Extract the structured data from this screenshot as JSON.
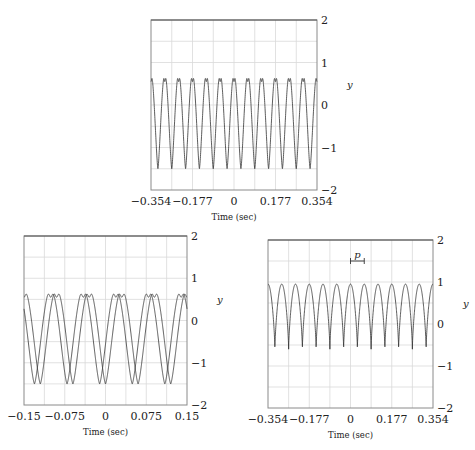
{
  "chart_data": [
    {
      "id": "top",
      "type": "line",
      "title": "",
      "xlabel": "Time (sec)",
      "ylabel": "y",
      "xlim": [
        -0.354,
        0.354
      ],
      "ylim": [
        -2,
        2
      ],
      "xticks": [
        -0.354,
        -0.177,
        0,
        0.177,
        0.354
      ],
      "xtick_labels": [
        "−0.354",
        "−0.177",
        "0",
        "0.177",
        "0.354"
      ],
      "yticks": [
        -2,
        -1,
        0,
        1,
        2
      ],
      "ytick_labels": [
        "−2",
        "−1",
        "0",
        "1",
        "2"
      ],
      "grid": true,
      "vgrid": 8,
      "hgrid": 8,
      "waveform": "m-peak",
      "periods": 12,
      "peak": 0.75,
      "peak_dip": 0.55,
      "trough": -1.5,
      "traces": 1,
      "phase_offsets": [
        0
      ],
      "box": {
        "x": 151,
        "y": 20,
        "w": 166,
        "h": 170
      }
    },
    {
      "id": "bottom-left",
      "type": "line",
      "title": "",
      "xlabel": "Time (sec)",
      "ylabel": "y",
      "xlim": [
        -0.15,
        0.15
      ],
      "ylim": [
        -2,
        2
      ],
      "xticks": [
        -0.15,
        -0.075,
        0,
        0.075,
        0.15
      ],
      "xtick_labels": [
        "−0.15",
        "−0.075",
        "0",
        "0.075",
        "0.15"
      ],
      "yticks": [
        -2,
        -1,
        0,
        1,
        2
      ],
      "ytick_labels": [
        "−2",
        "−1",
        "0",
        "1",
        "2"
      ],
      "grid": true,
      "vgrid": 8,
      "hgrid": 8,
      "waveform": "m-peak",
      "periods": 5,
      "peak": 0.75,
      "peak_dip": 0.55,
      "trough": -1.5,
      "traces": 2,
      "phase_offsets": [
        0,
        0.18
      ],
      "box": {
        "x": 24,
        "y": 236,
        "w": 163,
        "h": 169
      }
    },
    {
      "id": "bottom-right",
      "type": "line",
      "title": "",
      "xlabel": "Time (sec)",
      "ylabel": "y",
      "xlim": [
        -0.354,
        0.354
      ],
      "ylim": [
        -2,
        2
      ],
      "xticks": [
        -0.354,
        -0.177,
        0,
        0.177,
        0.354
      ],
      "xtick_labels": [
        "−0.354",
        "−0.177",
        "0",
        "0.177",
        "0.354"
      ],
      "yticks": [
        -2,
        -1,
        0,
        1,
        2
      ],
      "ytick_labels": [
        "−2",
        "−1",
        "0",
        "1",
        "2"
      ],
      "grid": true,
      "vgrid": 8,
      "hgrid": 8,
      "waveform": "sharp-peak",
      "periods": 12,
      "peak": 0.95,
      "trough": -0.6,
      "traces": 1,
      "phase_offsets": [
        0
      ],
      "annotation": {
        "label": "p",
        "x_start": 0,
        "x_end": 0.059,
        "y": 1.5
      },
      "box": {
        "x": 268,
        "y": 240,
        "w": 165,
        "h": 168
      }
    }
  ]
}
